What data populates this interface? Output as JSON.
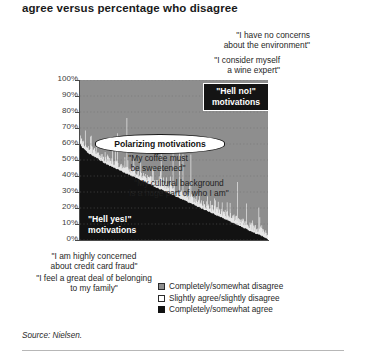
{
  "title": "agree versus percentage who disagree",
  "source": "Source: Nielsen.",
  "colors": {
    "disagree": "#8e8e8e",
    "slightly": "#ffffff",
    "agree": "#121212",
    "axis": "#4a4a4a",
    "grid": "#9a9a9a",
    "text": "#1f1f1f",
    "rule": "#b7b7b7"
  },
  "axis": {
    "ylabels": [
      "100%",
      "90%",
      "80%",
      "70%",
      "60%",
      "50%",
      "40%",
      "30%",
      "20%",
      "10%",
      "0%"
    ]
  },
  "annotations": {
    "environment": "\"I have no concerns\nabout the environment\"",
    "wine": "\"I consider myself\na wine expert\"",
    "hell_no": "\"Hell no!\"\nmotivations",
    "polarizing": "Polarizing motivations",
    "coffee": "\"My coffee must\nbe sweetened\"",
    "cultural": "\"My cultural background\nis a huge part of who I am\"",
    "hell_yes": "\"Hell yes!\"\nmotivations",
    "credit_card": "\"I am highly concerned\nabout credit card fraud\"",
    "belonging": "\"I feel a great deal of belonging\nto my family\""
  },
  "legend": [
    {
      "swatch": "gray",
      "label": "Completely/somewhat disagree"
    },
    {
      "swatch": "white",
      "label": "Slightly agree/slightly disagree"
    },
    {
      "swatch": "black",
      "label": "Completely/somewhat agree"
    }
  ],
  "chart_data": {
    "type": "area",
    "title": "agree versus percentage who disagree",
    "xlabel": "",
    "ylabel": "",
    "ylim": [
      0,
      100
    ],
    "grid": true,
    "legend_position": "bottom-right",
    "stacked": true,
    "note": "Stacked 100% area: each x is one survey statement, sorted by percent who completely/somewhat agree (descending). Bottom black band = agree, thin white band = slightly agree/slightly disagree, top gray band = disagree.",
    "categories_note": "~200 survey statements, unlabeled on x-axis",
    "series": [
      {
        "name": "Completely/somewhat agree",
        "color": "#121212",
        "values": [
          60,
          58,
          57,
          56,
          55,
          54,
          53.5,
          53,
          52,
          51.5,
          51,
          50,
          49.5,
          49,
          48,
          47.5,
          47,
          46.5,
          46,
          45.5,
          45,
          44.5,
          44,
          43.5,
          43,
          42.5,
          42,
          41.5,
          41,
          40.5,
          40,
          39.5,
          39,
          38.5,
          38,
          37.5,
          37,
          36.5,
          36,
          35.5,
          35,
          34.5,
          34,
          33.5,
          33,
          32.5,
          32,
          31.5,
          31,
          30.5,
          30,
          29.5,
          29,
          28.5,
          28,
          27.5,
          27,
          26.5,
          26,
          25.5,
          25,
          24.5,
          24,
          23.5,
          23,
          22.5,
          22,
          21.5,
          21,
          20.5,
          20,
          19.5,
          19,
          18.5,
          18,
          17.5,
          17,
          16.5,
          16,
          15.5,
          15,
          14.5,
          14,
          13.5,
          13,
          12.5,
          12,
          11.5,
          11,
          10.5,
          10,
          9.5,
          9,
          8.5,
          8,
          7.5,
          7,
          6.5,
          6,
          5.5,
          5,
          4.5,
          4,
          3.5,
          3,
          2.5,
          2,
          1.5,
          1,
          0.5
        ]
      },
      {
        "name": "Slightly agree/slightly disagree",
        "color": "#ffffff",
        "values_note": "narrow irregular band, typically 2-12 percentage points, spiking up to ~40 points at scattered statements",
        "typical": 6,
        "min": 1,
        "max": 40
      },
      {
        "name": "Completely/somewhat disagree",
        "color": "#8e8e8e",
        "values_note": "remainder to 100%; rises from ~34% at left to ~95% at right"
      }
    ],
    "callouts": [
      {
        "text": "\"I have no concerns about the environment\"",
        "points_to": "right end, low agree"
      },
      {
        "text": "\"I consider myself a wine expert\"",
        "points_to": "right side, low agree"
      },
      {
        "text": "\"Hell no!\" motivations",
        "region": "upper-right gray zone"
      },
      {
        "text": "Polarizing motivations",
        "region": "middle band"
      },
      {
        "text": "\"My coffee must be sweetened\"",
        "region": "middle"
      },
      {
        "text": "\"My cultural background is a huge part of who I am\"",
        "region": "middle"
      },
      {
        "text": "\"Hell yes!\" motivations",
        "region": "lower-left black zone"
      },
      {
        "text": "\"I am highly concerned about credit card fraud\"",
        "points_to": "left end, high agree"
      },
      {
        "text": "\"I feel a great deal of belonging to my family\"",
        "points_to": "left end, high agree"
      }
    ]
  }
}
